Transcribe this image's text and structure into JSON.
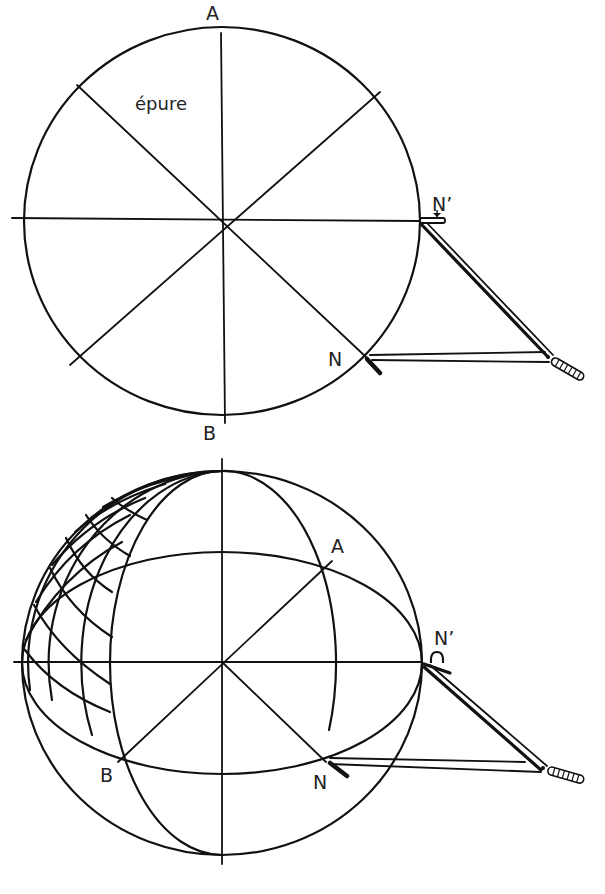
{
  "figure_top": {
    "title": "Épure (flat construction drawing)",
    "labels": {
      "top_point": "A",
      "bottom_point": "B",
      "caption_word": "épure",
      "compass_pivot": "N’",
      "compass_needle": "N"
    },
    "elements": [
      "circle divided by 4 diameters into 8 sectors",
      "vertical diameter A–B",
      "horizontal diameter through N’",
      "two diagonal diameters (45°), one ending at N",
      "compass with pivot at N’ and tip at N"
    ]
  },
  "figure_bottom": {
    "title": "Sphere in perspective",
    "labels": {
      "point_a": "A",
      "point_b": "B",
      "compass_pivot": "N’",
      "compass_needle": "N"
    },
    "elements": [
      "sphere outline",
      "equator drawn as horizontal ellipse",
      "meridians converging at top and bottom poles",
      "grid of meridians and parallels on left portion",
      "diagonals through center to A and B",
      "compass with pivot at N’ and tip at N"
    ]
  },
  "colors": {
    "ink": "#111111",
    "paper": "#ffffff"
  }
}
